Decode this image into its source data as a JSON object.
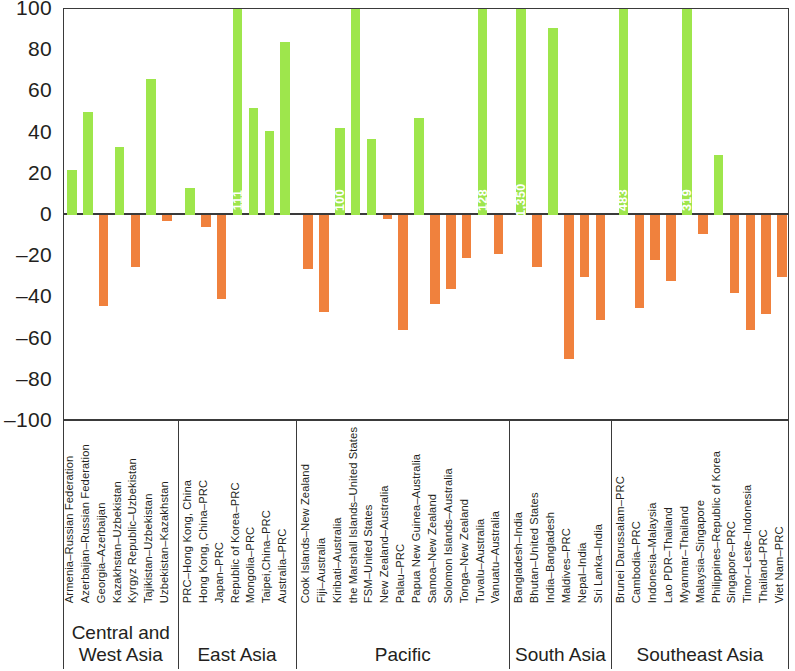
{
  "chart_data": {
    "type": "bar",
    "title": "",
    "xlabel": "",
    "ylabel": "",
    "ylim": [
      -100,
      100
    ],
    "yticks": [
      100,
      80,
      60,
      40,
      20,
      0,
      -20,
      -40,
      -60,
      -80,
      -100
    ],
    "ytick_labels": [
      "100",
      "80",
      "60",
      "40",
      "20",
      "0",
      "-20",
      "-40",
      "-60",
      "-80",
      "-100"
    ],
    "grid": false,
    "legend": null,
    "colors": {
      "positive": "#9ee64c",
      "negative": "#f0813d",
      "axis": "#3a3a3a"
    },
    "groups": [
      {
        "name": "Central and West Asia",
        "categories": [
          "Armenia-Russian Federation",
          "Azerbaijan-Russian Federation",
          "Georgia-Azerbaijan",
          "Kazakhstan-Uzbekistan",
          "Kyrgyz Republic-Uzbekistan",
          "Tajikistan-Uzbekistan",
          "Uzbekistan-Kazakhstan"
        ],
        "values": [
          22,
          50,
          -44,
          33,
          -25,
          66,
          -3
        ]
      },
      {
        "name": "East Asia",
        "categories": [
          "PRC-Hong Kong, China",
          "Hong Kong, China-PRC",
          "Japan-PRC",
          "Republic of Korea-PRC",
          "Mongolia-PRC",
          "Taipei,China-PRC",
          "Australia-PRC"
        ],
        "values": [
          13,
          -6,
          -41,
          111,
          52,
          41,
          84
        ],
        "labels": {
          "Republic of Korea-PRC": "111"
        }
      },
      {
        "name": "Pacific",
        "categories": [
          "Cook Islands-New Zealand",
          "Fiji-Australia",
          "Kiribati-Australia",
          "the Marshall Islands-United States",
          "FSM-United States",
          "New Zealand-Australia",
          "Palau-PRC",
          "Papua New Guinea-Australia",
          "Samoa-New Zealand",
          "Solomon Islands-Australia",
          "Tonga-New Zealand",
          "Tuvalu-Australia",
          "Vanuatu-Australia"
        ],
        "values": [
          -26,
          -47,
          42,
          100,
          37,
          -2,
          -56,
          47,
          -43,
          -36,
          -21,
          128,
          -19
        ],
        "labels": {
          "Kiribati-Australia": "100",
          "Tuvalu-Australia": "128"
        }
      },
      {
        "name": "South Asia",
        "categories": [
          "Bangladesh-India",
          "Bhutan-United States",
          "India-Bangladesh",
          "Maldives-PRC",
          "Nepal-India",
          "Sri Lanka-India"
        ],
        "values": [
          1350,
          -25,
          91,
          -70,
          -30,
          -51
        ],
        "labels": {
          "Bangladesh-India": "1,350"
        }
      },
      {
        "name": "Southeast Asia",
        "categories": [
          "Brunei Darussalam-PRC",
          "Cambodia-PRC",
          "Indonesia-Malaysia",
          "Lao PDR-Thailand",
          "Myanmar-Thailand",
          "Malaysia-Singapore",
          "Philippines-Republic of Korea",
          "Singapore-PRC",
          "Timor-Leste-Indonesia",
          "Thailand-PRC",
          "Viet Nam-PRC"
        ],
        "values": [
          483,
          -45,
          -22,
          -32,
          319,
          -9,
          29,
          -38,
          -56,
          -48,
          -30
        ],
        "labels": {
          "Brunei Darussalam-PRC": "483",
          "Myanmar-Thailand": "319"
        }
      }
    ]
  }
}
